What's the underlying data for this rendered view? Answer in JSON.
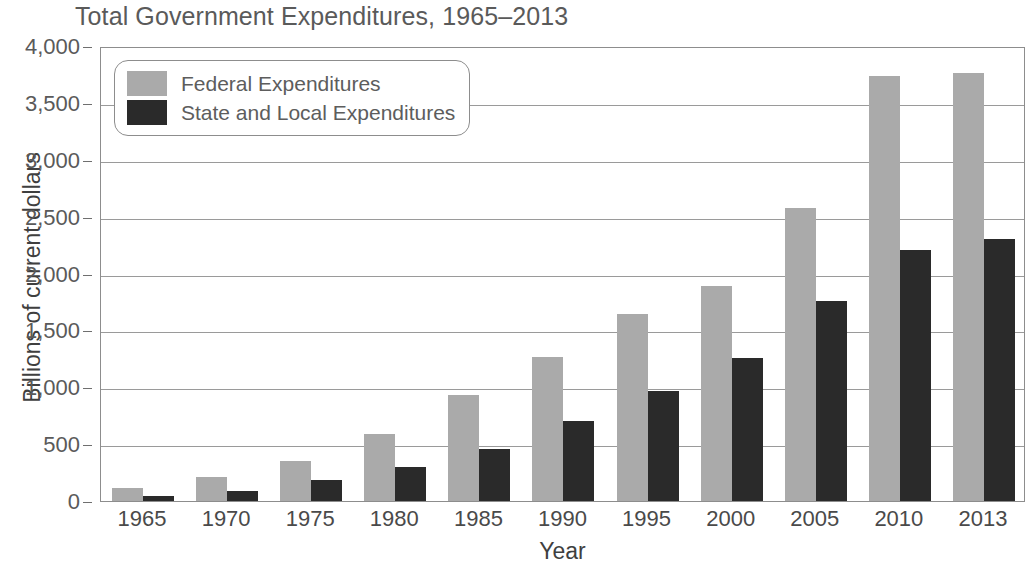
{
  "chart_data": {
    "type": "bar",
    "title": "Total Government Expenditures, 1965–2013",
    "xlabel": "Year",
    "ylabel": "Billions of current dollars",
    "categories": [
      "1965",
      "1970",
      "1975",
      "1980",
      "1985",
      "1990",
      "1995",
      "2000",
      "2005",
      "2010",
      "2013"
    ],
    "series": [
      {
        "name": "Federal Expenditures",
        "color": "#aaaaaa",
        "values": [
          118,
          210,
          350,
          590,
          935,
          1265,
          1640,
          1890,
          2580,
          3740,
          3760
        ]
      },
      {
        "name": "State and Local Expenditures",
        "color": "#2a2a2a",
        "values": [
          47,
          90,
          185,
          300,
          460,
          700,
          965,
          1260,
          1755,
          2205,
          2305
        ]
      }
    ],
    "ylim": [
      0,
      4000
    ],
    "ytick_values": [
      0,
      500,
      1000,
      1500,
      2000,
      2500,
      3000,
      3500,
      4000
    ],
    "ytick_labels": [
      "0",
      "500",
      "1,000",
      "1,500",
      "2,000",
      "2,500",
      "3,000",
      "3,500",
      "4,000"
    ],
    "grid": true,
    "legend_position": "upper-left-inside"
  },
  "legend": {
    "items": [
      {
        "label": "Federal Expenditures",
        "swatch": "legend-swatch-federal"
      },
      {
        "label": "State and Local Expenditures",
        "swatch": "legend-swatch-state-local"
      }
    ]
  }
}
